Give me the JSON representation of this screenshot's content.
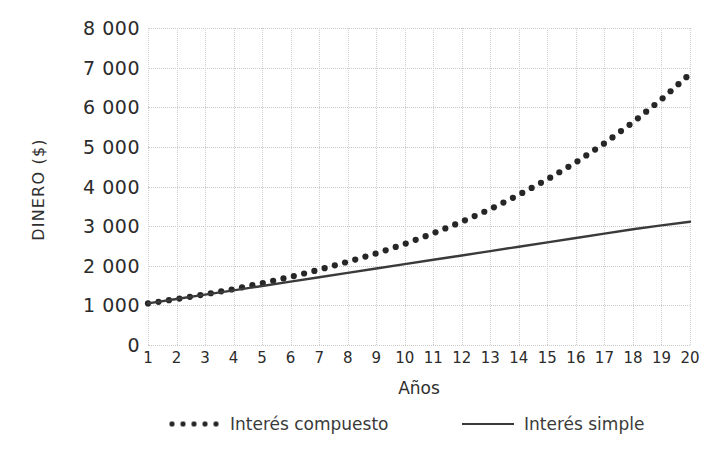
{
  "chart_data": {
    "type": "line",
    "title": "",
    "xlabel": "Años",
    "ylabel": "DINERO ($)",
    "xlim": [
      1,
      20
    ],
    "ylim": [
      0,
      8000
    ],
    "grid": true,
    "legend_position": "bottom",
    "y_ticks": [
      0,
      1000,
      2000,
      3000,
      4000,
      5000,
      6000,
      7000,
      8000
    ],
    "y_tick_labels": [
      "0",
      "1 000",
      "2 000",
      "3 000",
      "4 000",
      "5 000",
      "6 000",
      "7 000",
      "8 000"
    ],
    "x_ticks": [
      1,
      2,
      3,
      4,
      5,
      6,
      7,
      8,
      9,
      10,
      11,
      12,
      13,
      14,
      15,
      16,
      17,
      18,
      19,
      20
    ],
    "x_tick_labels": [
      "1",
      "2",
      "3",
      "4",
      "5",
      "6",
      "7",
      "8",
      "9",
      "10",
      "11",
      "12",
      "13",
      "14",
      "15",
      "16",
      "17",
      "18",
      "19",
      "20"
    ],
    "x": [
      1,
      2,
      3,
      4,
      5,
      6,
      7,
      8,
      9,
      10,
      11,
      12,
      13,
      14,
      15,
      16,
      17,
      18,
      19,
      20
    ],
    "series": [
      {
        "name": "Interés compuesto",
        "style": "dotted",
        "color": "#262626",
        "values": [
          1050,
          1160,
          1280,
          1410,
          1560,
          1720,
          1900,
          2100,
          2310,
          2550,
          2820,
          3110,
          3430,
          3790,
          4180,
          4610,
          5090,
          5620,
          6200,
          6840
        ]
      },
      {
        "name": "Interés simple",
        "style": "solid",
        "color": "#3a3a3a",
        "values": [
          1050,
          1160,
          1270,
          1380,
          1490,
          1600,
          1710,
          1820,
          1930,
          2040,
          2150,
          2260,
          2370,
          2480,
          2590,
          2700,
          2810,
          2920,
          3020,
          3110
        ]
      }
    ]
  },
  "legend": [
    {
      "label": "Interés compuesto",
      "marker": "dotted-line-marker"
    },
    {
      "label": "Interés simple",
      "marker": "solid-line-marker"
    }
  ]
}
